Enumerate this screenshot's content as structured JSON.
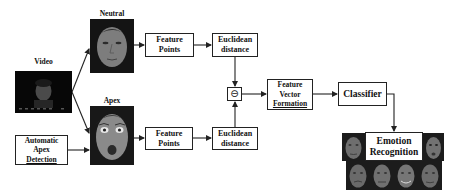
{
  "diagram": {
    "title": "",
    "labels": {
      "video": "Video",
      "neutral": "Neutral",
      "apex": "Apex"
    },
    "nodes": {
      "auto_apex": [
        "Automatic",
        "Apex",
        "Detection"
      ],
      "feature_points_top": [
        "Feature",
        "Points"
      ],
      "euclidean_top": [
        "Euclidean",
        "distance"
      ],
      "feature_points_bottom": [
        "Feature",
        "Points"
      ],
      "euclidean_bottom": [
        "Euclidean",
        "distance"
      ],
      "subtract": "⊖",
      "feature_vector": [
        "Feature",
        "Vector",
        "Formation"
      ],
      "classifier": "Classifier",
      "emotion": [
        "Emotion",
        "Recognition"
      ]
    },
    "images": {
      "video": "video-frame-face",
      "neutral": "neutral-face",
      "apex": "apex-surprised-face",
      "emotion_examples": [
        "emotion-face-1",
        "emotion-face-2",
        "emotion-face-3",
        "emotion-face-4",
        "emotion-face-5",
        "emotion-face-6"
      ]
    },
    "edges": [
      [
        "video",
        "neutral"
      ],
      [
        "video",
        "apex"
      ],
      [
        "auto_apex",
        "apex"
      ],
      [
        "neutral",
        "feature_points_top"
      ],
      [
        "feature_points_top",
        "euclidean_top"
      ],
      [
        "euclidean_top",
        "subtract"
      ],
      [
        "apex",
        "feature_points_bottom"
      ],
      [
        "feature_points_bottom",
        "euclidean_bottom"
      ],
      [
        "euclidean_bottom",
        "subtract"
      ],
      [
        "subtract",
        "feature_vector"
      ],
      [
        "feature_vector",
        "classifier"
      ],
      [
        "classifier",
        "emotion"
      ]
    ],
    "colors": {
      "line": "#222222",
      "background": "#ffffff",
      "photo_dark": "#0d0d0d",
      "photo_face": "#8a8a8a"
    }
  }
}
